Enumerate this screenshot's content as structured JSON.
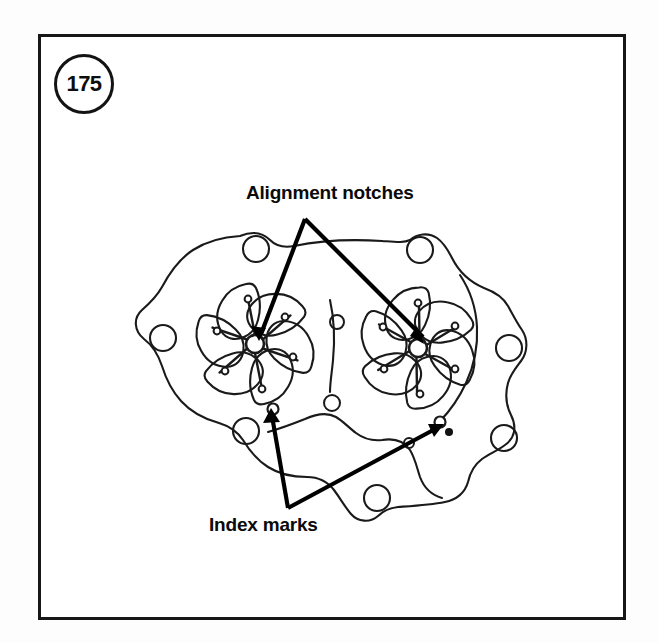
{
  "figure": {
    "number": "175",
    "badge_name": "figure-number-175"
  },
  "labels": {
    "alignment_notches": "Alignment notches",
    "index_marks": "Index marks"
  },
  "colors": {
    "frame_border": "#171717",
    "line_art": "#1a1a1a",
    "leader_line": "#000000",
    "page_background": "#fdfdfd",
    "figure_background": "#ffffff"
  },
  "diagram": {
    "type": "technical-line-drawing",
    "rotors": [
      {
        "name": "left-rotor",
        "center_x": 255,
        "center_y": 344,
        "lobe_count": 6,
        "hub_radius": 9
      },
      {
        "name": "right-rotor",
        "center_x": 418,
        "center_y": 348,
        "lobe_count": 6,
        "hub_radius": 9
      }
    ],
    "alignment_notch_points": [
      {
        "x": 258,
        "y": 338
      },
      {
        "x": 420,
        "y": 341
      }
    ],
    "index_mark_points": [
      {
        "x": 273,
        "y": 409
      },
      {
        "x": 440,
        "y": 422
      }
    ],
    "leader_apexes": {
      "alignment_notches": {
        "x": 305,
        "y": 219
      },
      "index_marks": {
        "x": 288,
        "y": 508
      }
    },
    "bolt_holes": [
      {
        "x": 256,
        "y": 249,
        "r": 13
      },
      {
        "x": 420,
        "y": 250,
        "r": 13
      },
      {
        "x": 163,
        "y": 338,
        "r": 13
      },
      {
        "x": 509,
        "y": 348,
        "r": 13
      },
      {
        "x": 504,
        "y": 438,
        "r": 13
      },
      {
        "x": 246,
        "y": 431,
        "r": 13
      },
      {
        "x": 377,
        "y": 498,
        "r": 13
      }
    ],
    "small_holes": [
      {
        "x": 337,
        "y": 322,
        "r": 7
      },
      {
        "x": 332,
        "y": 403,
        "r": 8
      },
      {
        "x": 409,
        "y": 443,
        "r": 5
      }
    ],
    "index_dot": {
      "x": 449,
      "y": 432,
      "r": 4
    }
  }
}
